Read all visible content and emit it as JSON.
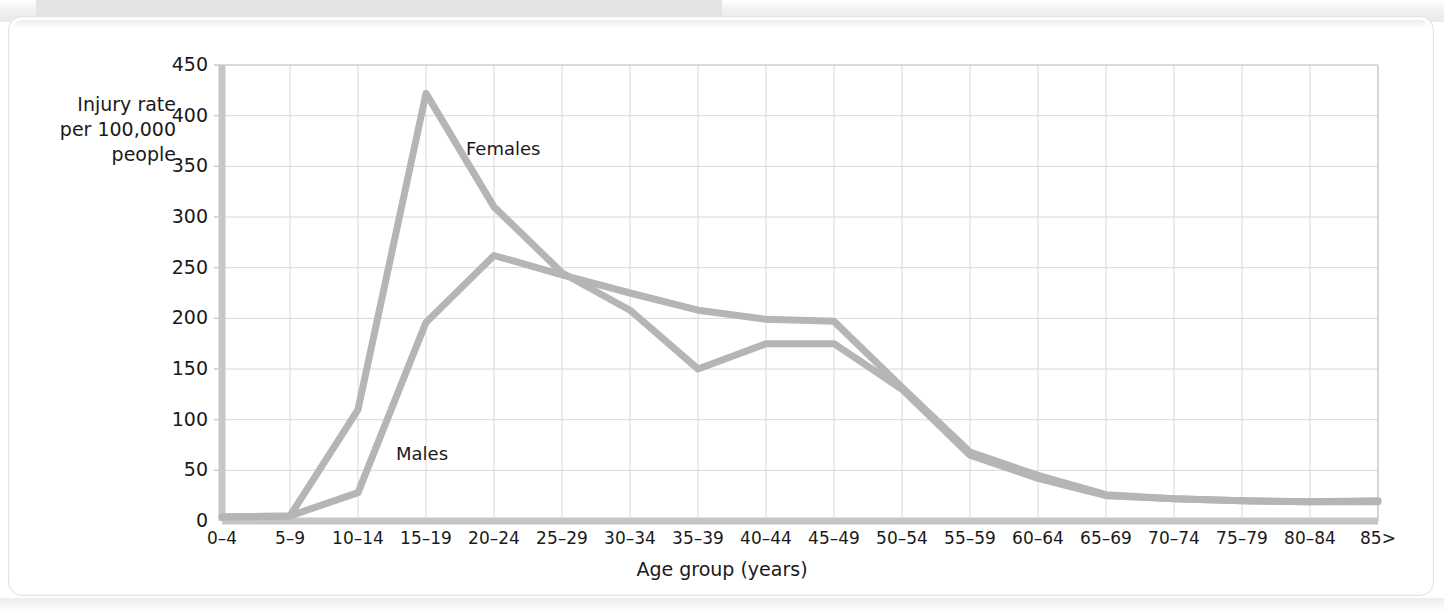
{
  "page": {
    "background_color": "#ffffff",
    "card_color": "#ffffff"
  },
  "chart_data": {
    "type": "line",
    "title": "",
    "xlabel": "Age group (years)",
    "ylabel": "Injury rate\nper 100,000\npeople",
    "ylim": [
      0,
      450
    ],
    "yticks": [
      0,
      50,
      100,
      150,
      200,
      250,
      300,
      350,
      400,
      450
    ],
    "ytick_labels": [
      "0",
      "50",
      "100",
      "150",
      "200",
      "250",
      "300",
      "350",
      "400",
      "450"
    ],
    "grid": true,
    "legend_position": "inline-annotations",
    "line_color": "#b5b5b5",
    "grid_color": "#d8d8d8",
    "axis_color": "#c9c9c9",
    "categories": [
      "0–4",
      "5–9",
      "10–14",
      "15–19",
      "20–24",
      "25–29",
      "30–34",
      "35–39",
      "40–44",
      "45–49",
      "50–54",
      "55–59",
      "60–64",
      "65–69",
      "70–74",
      "75–79",
      "80–84",
      "85>"
    ],
    "series": [
      {
        "name": "Females",
        "color": "#b5b5b5",
        "values": [
          4,
          5,
          110,
          422,
          310,
          245,
          208,
          150,
          175,
          175,
          130,
          65,
          42,
          25,
          22,
          20,
          19,
          19
        ],
        "label_x_category": "15–19",
        "label_text": "Females"
      },
      {
        "name": "Males",
        "color": "#b5b5b5",
        "values": [
          4,
          5,
          28,
          196,
          262,
          243,
          225,
          208,
          199,
          197,
          132,
          68,
          45,
          26,
          22,
          20,
          19,
          20
        ],
        "label_x_category": "10–14",
        "label_text": "Males"
      }
    ],
    "annotations": [
      {
        "text": "Females",
        "x_px": 466,
        "y_px": 138
      },
      {
        "text": "Males",
        "x_px": 396,
        "y_px": 443
      }
    ]
  }
}
